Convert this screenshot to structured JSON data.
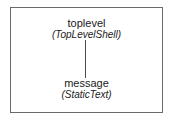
{
  "diagram": {
    "type": "widget-tree",
    "nodes": [
      {
        "id": "toplevel",
        "name": "toplevel",
        "class_label": "(TopLevelShell)"
      },
      {
        "id": "message",
        "name": "message",
        "class_label": "(StaticText)"
      }
    ],
    "edges": [
      {
        "from": "toplevel",
        "to": "message"
      }
    ],
    "colors": {
      "border": "#6a6a6a",
      "line": "#4a4a4a",
      "text": "#1a1a1a",
      "background": "#ffffff"
    }
  }
}
